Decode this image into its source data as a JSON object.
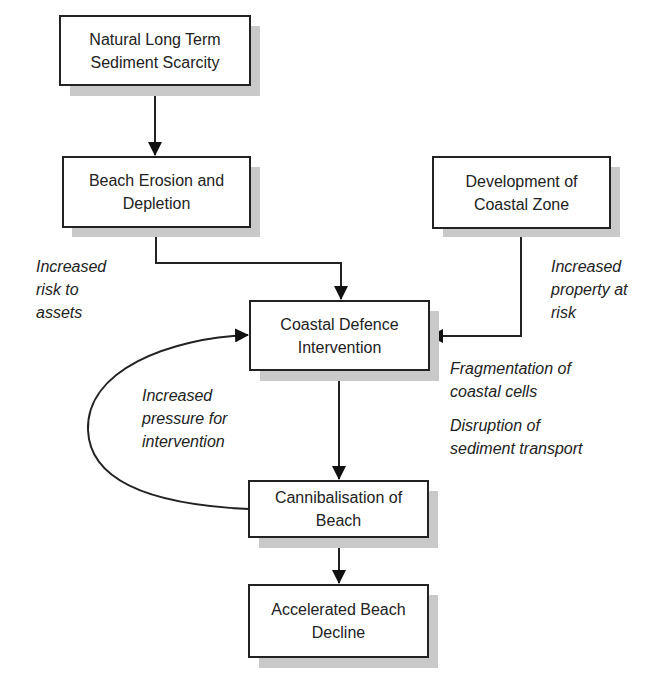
{
  "diagram": {
    "nodes": [
      {
        "id": "natural-scarcity",
        "lines": [
          "Natural Long Term",
          "Sediment Scarcity"
        ]
      },
      {
        "id": "beach-erosion",
        "lines": [
          "Beach Erosion and",
          "Depletion"
        ]
      },
      {
        "id": "coastal-development",
        "lines": [
          "Development of",
          "Coastal Zone"
        ]
      },
      {
        "id": "coastal-defence",
        "lines": [
          "Coastal Defence",
          "Intervention"
        ]
      },
      {
        "id": "cannibalisation",
        "lines": [
          "Cannibalisation of",
          "Beach"
        ]
      },
      {
        "id": "accelerated-decline",
        "lines": [
          "Accelerated Beach",
          "Decline"
        ]
      }
    ],
    "annotations": {
      "risk_to_assets": [
        "Increased",
        "risk to",
        "assets"
      ],
      "property_at_risk": [
        "Increased",
        "property at",
        "risk"
      ],
      "pressure_for_intervention": [
        "Increased",
        "pressure for",
        "intervention"
      ],
      "fragmentation": [
        "Fragmentation of",
        "coastal cells"
      ],
      "disruption": [
        "Disruption of",
        "sediment transport"
      ]
    },
    "edges": [
      {
        "from": "natural-scarcity",
        "to": "beach-erosion"
      },
      {
        "from": "beach-erosion",
        "to": "coastal-defence"
      },
      {
        "from": "coastal-development",
        "to": "coastal-defence"
      },
      {
        "from": "coastal-defence",
        "to": "cannibalisation"
      },
      {
        "from": "cannibalisation",
        "to": "coastal-defence",
        "style": "curved-feedback"
      },
      {
        "from": "cannibalisation",
        "to": "accelerated-decline"
      }
    ]
  }
}
